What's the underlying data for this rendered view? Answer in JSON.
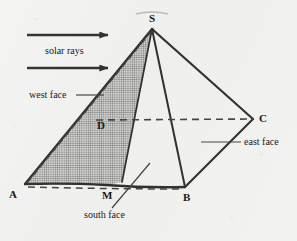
{
  "figure": {
    "background_color": "#f2f2f0",
    "ink_color": "#191919"
  },
  "annotations": {
    "solar_rays": "solar rays",
    "west_face": "west face",
    "east_face": "east face",
    "south_face": "south face"
  },
  "vertices": {
    "S": "S",
    "A": "A",
    "B": "B",
    "C": "C",
    "D": "D",
    "M": "M"
  },
  "geometry": {
    "apex_S": [
      152,
      29
    ],
    "corner_A": [
      25,
      184
    ],
    "corner_B": [
      185,
      187
    ],
    "corner_C": [
      253,
      119
    ],
    "point_D": [
      100,
      118
    ],
    "point_M": [
      106,
      185
    ],
    "arrow_top": {
      "x1": 27,
      "y1": 35,
      "x2": 110,
      "y2": 35
    },
    "arrow_bottom": {
      "x1": 27,
      "y1": 68,
      "x2": 110,
      "y2": 68
    }
  }
}
